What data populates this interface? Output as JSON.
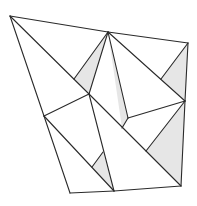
{
  "diagram": {
    "title": "",
    "type": "polygon-dissection",
    "colors": {
      "stroke": "#2a2a2a",
      "shade": "#e6e6e6",
      "background": "#ffffff"
    },
    "vertices": {
      "A": [
        10,
        16
      ],
      "B": [
        108,
        32
      ],
      "C": [
        188,
        43
      ],
      "D": [
        185,
        101
      ],
      "E": [
        181,
        186
      ],
      "F": [
        114,
        191
      ],
      "G": [
        70,
        193
      ],
      "H": [
        44,
        116
      ],
      "I": [
        89,
        94
      ],
      "J": [
        128,
        118
      ],
      "K": [
        74,
        79
      ],
      "L": [
        161,
        79
      ],
      "M": [
        146,
        151
      ],
      "N": [
        103,
        152
      ],
      "O": [
        92,
        167
      ],
      "P": [
        122,
        128
      ]
    },
    "shaded_triangles": [
      [
        "B",
        "K",
        "I"
      ],
      [
        "C",
        "L",
        "D"
      ],
      [
        "D",
        "M",
        "E"
      ],
      [
        "N",
        "O",
        "F"
      ],
      [
        "J",
        "P",
        "B"
      ]
    ],
    "edges": [
      [
        "A",
        "B"
      ],
      [
        "B",
        "C"
      ],
      [
        "C",
        "D"
      ],
      [
        "D",
        "E"
      ],
      [
        "E",
        "F"
      ],
      [
        "F",
        "G"
      ],
      [
        "G",
        "H"
      ],
      [
        "H",
        "A"
      ],
      [
        "A",
        "I"
      ],
      [
        "I",
        "E"
      ],
      [
        "B",
        "K"
      ],
      [
        "B",
        "I"
      ],
      [
        "B",
        "J"
      ],
      [
        "B",
        "D"
      ],
      [
        "I",
        "H"
      ],
      [
        "I",
        "F"
      ],
      [
        "H",
        "F"
      ],
      [
        "J",
        "D"
      ],
      [
        "J",
        "P"
      ],
      [
        "M",
        "D"
      ],
      [
        "L",
        "C"
      ],
      [
        "N",
        "O"
      ]
    ]
  }
}
